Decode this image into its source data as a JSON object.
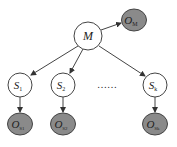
{
  "diagram": {
    "type": "directed graphical model",
    "nodes": [
      {
        "id": "M",
        "label": "M",
        "sub": "",
        "observed": false
      },
      {
        "id": "OM",
        "label": "O",
        "sub": "M",
        "observed": true
      },
      {
        "id": "S1",
        "label": "S",
        "sub": "1",
        "observed": false
      },
      {
        "id": "S2",
        "label": "S",
        "sub": "2",
        "observed": false
      },
      {
        "id": "Sk",
        "label": "S",
        "sub": "k",
        "observed": false
      },
      {
        "id": "OS1",
        "label": "O",
        "sub": "S1",
        "observed": true
      },
      {
        "id": "OS2",
        "label": "O",
        "sub": "S2",
        "observed": true
      },
      {
        "id": "OSk",
        "label": "O",
        "sub": "Sk",
        "observed": true
      }
    ],
    "edges": [
      [
        "M",
        "OM"
      ],
      [
        "M",
        "S1"
      ],
      [
        "M",
        "S2"
      ],
      [
        "M",
        "Sk"
      ],
      [
        "S1",
        "OS1"
      ],
      [
        "S2",
        "OS2"
      ],
      [
        "Sk",
        "OSk"
      ]
    ],
    "ellipsis": "……",
    "colors": {
      "observed_fill": "#8a8a8a",
      "latent_fill": "#ffffff",
      "stroke": "#444444"
    }
  }
}
